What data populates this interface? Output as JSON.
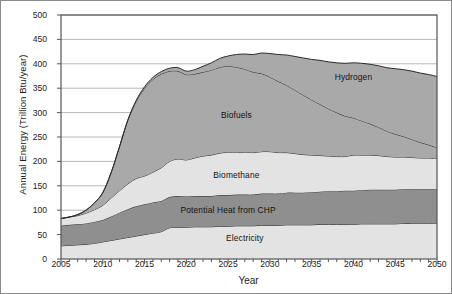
{
  "chart_data": {
    "type": "area",
    "stacked": true,
    "title": "",
    "subtitle": "",
    "xlabel": "Year",
    "ylabel": "Annual Energy (Trillion Btu/year)",
    "xlim": [
      2005,
      2050
    ],
    "ylim": [
      0,
      500
    ],
    "ytick_step": 50,
    "xtick_step": 5,
    "minor_xticks": true,
    "grid": "horizontal",
    "legend_position": "inline-band-labels",
    "xticks": [
      "2005",
      "2010",
      "2015",
      "2020",
      "2025",
      "2030",
      "2035",
      "2040",
      "2045",
      "2050"
    ],
    "yticks": [
      "0",
      "50",
      "100",
      "150",
      "200",
      "250",
      "300",
      "350",
      "400",
      "450",
      "500"
    ],
    "x": [
      2005,
      2006,
      2007,
      2008,
      2009,
      2010,
      2011,
      2012,
      2013,
      2014,
      2015,
      2016,
      2017,
      2018,
      2019,
      2020,
      2021,
      2022,
      2023,
      2024,
      2025,
      2026,
      2027,
      2028,
      2029,
      2030,
      2031,
      2032,
      2033,
      2034,
      2035,
      2036,
      2037,
      2038,
      2039,
      2040,
      2041,
      2042,
      2043,
      2044,
      2045,
      2046,
      2047,
      2048,
      2049,
      2050
    ],
    "series": [
      {
        "name": "Electricity",
        "color": "#e3e3e3",
        "values": [
          27,
          28,
          29,
          30,
          32,
          35,
          38,
          41,
          44,
          47,
          50,
          53,
          56,
          64,
          65,
          65,
          66,
          66,
          66,
          67,
          67,
          68,
          68,
          68,
          69,
          69,
          69,
          70,
          70,
          70,
          70,
          71,
          71,
          71,
          71,
          71,
          72,
          72,
          72,
          72,
          72,
          73,
          73,
          73,
          73,
          73
        ]
      },
      {
        "name": "Potential Heat from CHP",
        "color": "#8f8f8f",
        "values": [
          41,
          42,
          42,
          43,
          44,
          45,
          49,
          54,
          58,
          61,
          62,
          63,
          63,
          63,
          64,
          63,
          63,
          63,
          63,
          64,
          64,
          64,
          64,
          64,
          65,
          65,
          65,
          66,
          66,
          66,
          67,
          67,
          68,
          68,
          69,
          69,
          69,
          70,
          70,
          70,
          70,
          70,
          70,
          70,
          70,
          70
        ]
      },
      {
        "name": "Biomethane",
        "color": "#e3e3e3",
        "values": [
          15,
          16,
          18,
          21,
          25,
          30,
          38,
          45,
          52,
          57,
          58,
          62,
          68,
          73,
          76,
          75,
          78,
          82,
          84,
          86,
          88,
          87,
          87,
          86,
          86,
          86,
          84,
          82,
          80,
          78,
          76,
          74,
          72,
          71,
          70,
          73,
          72,
          71,
          70,
          68,
          67,
          66,
          65,
          64,
          64,
          63
        ]
      },
      {
        "name": "Biofuels",
        "color": "#a9a9a9",
        "values": [
          0,
          0,
          2,
          6,
          14,
          26,
          52,
          90,
          130,
          158,
          180,
          190,
          192,
          185,
          180,
          175,
          172,
          172,
          174,
          176,
          176,
          174,
          170,
          165,
          160,
          153,
          146,
          138,
          130,
          122,
          113,
          105,
          97,
          90,
          83,
          76,
          70,
          64,
          58,
          52,
          47,
          42,
          37,
          32,
          27,
          22
        ]
      },
      {
        "name": "Hydrogen",
        "color": "#a9a9a9",
        "values": [
          0,
          0,
          0,
          0,
          0,
          0,
          0,
          0,
          1,
          2,
          3,
          4,
          5,
          6,
          7,
          7,
          9,
          12,
          15,
          18,
          21,
          26,
          31,
          36,
          42,
          48,
          55,
          62,
          69,
          76,
          83,
          90,
          96,
          102,
          108,
          113,
          118,
          122,
          126,
          130,
          134,
          137,
          140,
          142,
          144,
          146
        ]
      }
    ],
    "cumulative_tops_2050": {
      "Electricity": 73,
      "Potential Heat from CHP": 143,
      "Biomethane": 206,
      "Biofuels": 290,
      "Hydrogen": 452
    },
    "band_labels": [
      {
        "text": "Hydrogen",
        "x": 2040,
        "y": 372
      },
      {
        "text": "Biofuels",
        "x": 2026,
        "y": 295
      },
      {
        "text": "Biomethane",
        "x": 2026,
        "y": 173
      },
      {
        "text": "Potential Heat from CHP",
        "x": 2025,
        "y": 100
      },
      {
        "text": "Electricity",
        "x": 2027,
        "y": 44
      }
    ]
  },
  "style": {
    "plot_border_color": "#555555",
    "grid_color": "#b7b7b7",
    "axis_text_color": "#1b1b1b",
    "figure_border_color": "#8a8a8a",
    "background": "#ffffff"
  }
}
